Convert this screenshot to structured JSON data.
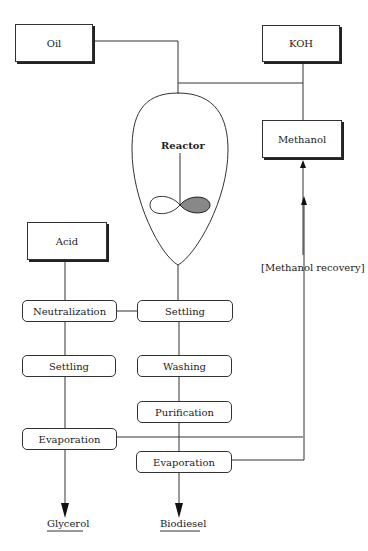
{
  "inputs": {
    "oil": "Oil",
    "koh": "KOH",
    "methanol": "Methanol",
    "acid": "Acid"
  },
  "reactor": {
    "label": "Reactor"
  },
  "methanol_recovery": "[Methanol recovery]",
  "glycerol_branch": {
    "steps": [
      "Neutralization",
      "Settling",
      "Evaporation"
    ],
    "product": "Glycerol"
  },
  "biodiesel_branch": {
    "steps": [
      "Settling",
      "Washing",
      "Purification",
      "Evaporation"
    ],
    "product": "Biodiesel"
  }
}
